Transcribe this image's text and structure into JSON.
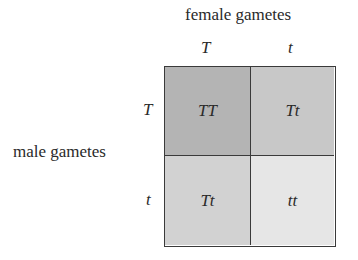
{
  "header": {
    "female_label": "female gametes",
    "male_label": "male gametes"
  },
  "female_alleles": [
    "T",
    "t"
  ],
  "male_alleles": [
    "T",
    "t"
  ],
  "cells": [
    {
      "genotype": "TT",
      "color": "#b4b4b4"
    },
    {
      "genotype": "Tt",
      "color": "#c8c8c8"
    },
    {
      "genotype": "Tt",
      "color": "#d2d2d2"
    },
    {
      "genotype": "tt",
      "color": "#e6e6e6"
    }
  ]
}
